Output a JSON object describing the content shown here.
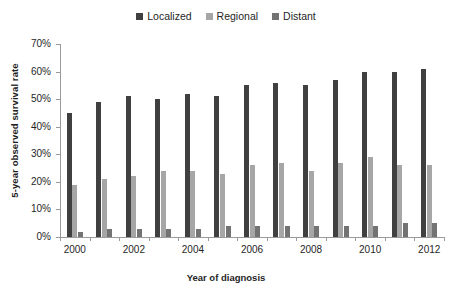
{
  "chart_data": {
    "type": "bar",
    "title": "",
    "xlabel": "Year of diagnosis",
    "ylabel": "5-year observed survival rate",
    "categories": [
      "2000",
      "2001",
      "2002",
      "2003",
      "2004",
      "2005",
      "2006",
      "2007",
      "2008",
      "2009",
      "2010",
      "2011",
      "2012"
    ],
    "visible_tick_labels": [
      "2000",
      "",
      "2002",
      "",
      "2004",
      "",
      "2006",
      "",
      "2008",
      "",
      "2010",
      "",
      "2012"
    ],
    "ylim": [
      0,
      70
    ],
    "yticks": [
      0,
      10,
      20,
      30,
      40,
      50,
      60,
      70
    ],
    "ytick_labels": [
      "0%",
      "10%",
      "20%",
      "30%",
      "40%",
      "50%",
      "60%",
      "70%"
    ],
    "grid": false,
    "legend_position": "top-center",
    "series": [
      {
        "name": "Localized",
        "color": "#404040",
        "values": [
          45,
          49,
          51,
          50,
          52,
          51,
          55,
          56,
          55,
          57,
          60,
          60,
          61
        ]
      },
      {
        "name": "Regional",
        "color": "#a6a6a6",
        "values": [
          19,
          21,
          22,
          24,
          24,
          23,
          26,
          27,
          24,
          27,
          29,
          26,
          26
        ]
      },
      {
        "name": "Distant",
        "color": "#737373",
        "values": [
          2,
          3,
          3,
          3,
          3,
          4,
          4,
          4,
          4,
          4,
          4,
          5,
          5
        ]
      }
    ]
  }
}
